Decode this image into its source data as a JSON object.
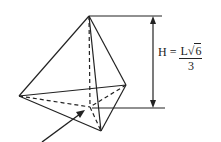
{
  "figure": {
    "type": "tetrahedron-height-diagram",
    "formula": {
      "lhs": "H = ",
      "numerator_L": "L",
      "radical": "√",
      "radicand": "6",
      "denominator": "3"
    },
    "colors": {
      "stroke": "#222222",
      "background": "#ffffff"
    },
    "vertices": {
      "apex": [
        89,
        16
      ],
      "left": [
        19,
        96
      ],
      "right": [
        126,
        85
      ],
      "bottom": [
        101,
        131
      ],
      "centroid": [
        90,
        107
      ]
    }
  }
}
